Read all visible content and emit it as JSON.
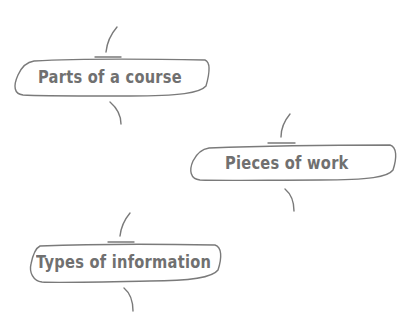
{
  "diagram": {
    "stroke_color": "#7a7a7a",
    "text_color": "#707070",
    "background": "#ffffff",
    "nodes": [
      {
        "label": "Parts of a course"
      },
      {
        "label": "Pieces of work"
      },
      {
        "label": "Types of information"
      }
    ]
  }
}
